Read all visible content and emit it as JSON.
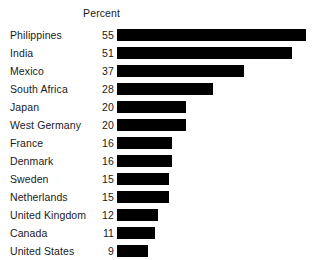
{
  "chart_data": {
    "type": "bar",
    "title": "",
    "subtitle": "",
    "xlabel": "",
    "ylabel": "",
    "value_header": "Percent",
    "orientation": "horizontal",
    "grid": false,
    "legend": null,
    "xlim": [
      0,
      55
    ],
    "bar_color": "#000000",
    "text_color": "#1a1a1a",
    "background": "#ffffff",
    "categories": [
      "Philippines",
      "India",
      "Mexico",
      "South Africa",
      "Japan",
      "West Germany",
      "France",
      "Denmark",
      "Sweden",
      "Netherlands",
      "United Kingdom",
      "Canada",
      "United States"
    ],
    "values": [
      55,
      51,
      37,
      28,
      20,
      20,
      16,
      16,
      15,
      15,
      12,
      11,
      9
    ],
    "value_labels": [
      "55",
      "51",
      "37",
      "28",
      "20",
      "20",
      "16",
      "16",
      "15",
      "15",
      "12",
      "11",
      "9"
    ],
    "rows": [
      {
        "label": "Philippines",
        "value": 55,
        "value_label": "55"
      },
      {
        "label": "India",
        "value": 51,
        "value_label": "51"
      },
      {
        "label": "Mexico",
        "value": 37,
        "value_label": "37"
      },
      {
        "label": "South Africa",
        "value": 28,
        "value_label": "28"
      },
      {
        "label": "Japan",
        "value": 20,
        "value_label": "20"
      },
      {
        "label": "West Germany",
        "value": 20,
        "value_label": "20"
      },
      {
        "label": "France",
        "value": 16,
        "value_label": "16"
      },
      {
        "label": "Denmark",
        "value": 16,
        "value_label": "16"
      },
      {
        "label": "Sweden",
        "value": 15,
        "value_label": "15"
      },
      {
        "label": "Netherlands",
        "value": 15,
        "value_label": "15"
      },
      {
        "label": "United Kingdom",
        "value": 12,
        "value_label": "12"
      },
      {
        "label": "Canada",
        "value": 11,
        "value_label": "11"
      },
      {
        "label": "United States",
        "value": 9,
        "value_label": "9"
      }
    ]
  }
}
